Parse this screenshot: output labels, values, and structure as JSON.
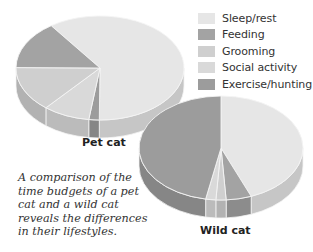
{
  "legend": {
    "items": [
      {
        "label": "Sleep/rest",
        "color": "#e6e6e6"
      },
      {
        "label": "Feeding",
        "color": "#a3a3a3"
      },
      {
        "label": "Grooming",
        "color": "#cfcfcf"
      },
      {
        "label": "Social activity",
        "color": "#d9d9d9"
      },
      {
        "label": "Exercise/hunting",
        "color": "#9c9c9c"
      }
    ]
  },
  "labels": {
    "pet_cat": "Pet cat",
    "wild_cat": "Wild cat"
  },
  "caption": "A comparison of the time budgets of a pet cat and a wild cat reveals the differences in their lifestyles.",
  "chart_data": [
    {
      "type": "pie",
      "title": "Pet cat",
      "categories": [
        "Sleep/rest",
        "Feeding",
        "Grooming",
        "Social activity",
        "Exercise/hunting"
      ],
      "values": [
        60,
        15,
        14,
        9,
        2
      ],
      "unit": "% of time (estimated)",
      "style": "3d",
      "legend_position": "top-right"
    },
    {
      "type": "pie",
      "title": "Wild cat",
      "categories": [
        "Sleep/rest",
        "Feeding",
        "Grooming",
        "Social activity",
        "Exercise/hunting"
      ],
      "values": [
        44,
        5,
        2,
        2,
        47
      ],
      "unit": "% of time (estimated)",
      "style": "3d",
      "legend_position": "top-right"
    }
  ]
}
